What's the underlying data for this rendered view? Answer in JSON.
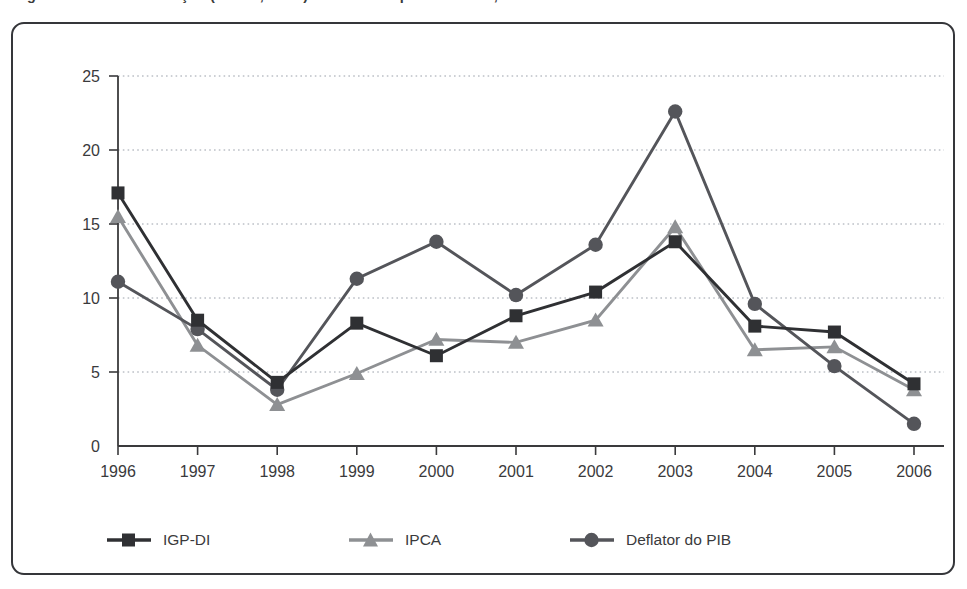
{
  "figure": {
    "caption": "Figura 1 - Taxas de inflação (IGP-DI, IPCA) e deflator implícito do PIB, 1996-2006",
    "frame_color": "#35363a",
    "background": "#ffffff"
  },
  "legend": {
    "position": "bottom",
    "items": [
      {
        "label": "IGP-DI",
        "marker": "square",
        "color": "#2f3033",
        "icon": "legend-line-square-icon"
      },
      {
        "label": "IPCA",
        "marker": "triangle",
        "color": "#8e9093",
        "icon": "legend-line-triangle-icon"
      },
      {
        "label": "Deflator do PIB",
        "marker": "circle",
        "color": "#54555a",
        "icon": "legend-line-circle-icon"
      }
    ]
  },
  "chart_data": {
    "type": "line",
    "title": "",
    "xlabel": "",
    "ylabel": "",
    "grid": true,
    "grid_style": "dotted-horizontal",
    "categories": [
      "1996",
      "1997",
      "1998",
      "1999",
      "2000",
      "2001",
      "2002",
      "2003",
      "2004",
      "2005",
      "2006"
    ],
    "x": [
      1996,
      1997,
      1998,
      1999,
      2000,
      2001,
      2002,
      2003,
      2004,
      2005,
      2006
    ],
    "xlim": [
      1996,
      2006
    ],
    "ylim": [
      0,
      25
    ],
    "yticks": [
      0,
      5,
      10,
      15,
      20,
      25
    ],
    "ytick_labels": [
      "0",
      "5",
      "10",
      "15",
      "20",
      "25"
    ],
    "series": [
      {
        "name": "IGP-DI",
        "marker": "square",
        "color": "#2f3033",
        "values": [
          17.1,
          8.5,
          4.3,
          8.3,
          6.1,
          8.8,
          10.4,
          13.8,
          8.1,
          7.7,
          4.2
        ]
      },
      {
        "name": "IPCA",
        "marker": "triangle",
        "color": "#8e9093",
        "values": [
          15.5,
          6.8,
          2.8,
          4.9,
          7.2,
          7.0,
          8.5,
          14.8,
          6.5,
          6.7,
          3.8
        ]
      },
      {
        "name": "Deflator do PIB",
        "marker": "circle",
        "color": "#54555a",
        "values": [
          11.1,
          7.9,
          3.8,
          11.3,
          13.8,
          10.2,
          13.6,
          22.6,
          9.6,
          5.4,
          1.5
        ]
      }
    ]
  }
}
